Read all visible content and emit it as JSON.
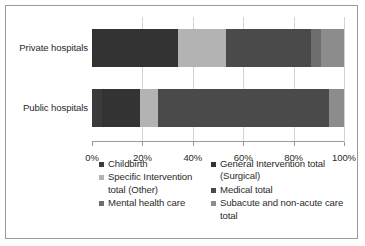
{
  "chart_data": {
    "type": "bar",
    "orientation": "horizontal",
    "stacked": true,
    "percent": true,
    "title": "",
    "xlabel": "",
    "ylabel": "",
    "xlim": [
      0,
      100
    ],
    "grid": true,
    "legend_position": "bottom",
    "tick_labels": [
      "0%",
      "20%",
      "40%",
      "60%",
      "80%",
      "100%"
    ],
    "tick_values": [
      0,
      20,
      40,
      60,
      80,
      100
    ],
    "categories": [
      "Private hospitals",
      "Public hospitals"
    ],
    "series": [
      {
        "name": "Childbirth",
        "color": "#3b3b3b",
        "values": [
          0.0,
          4.0
        ]
      },
      {
        "name": "General Intervention total (Surgical)",
        "color": "#333333",
        "values": [
          34.0,
          15.0
        ]
      },
      {
        "name": "Specific Intervention total (Other)",
        "color": "#b3b3b3",
        "values": [
          19.0,
          7.0
        ]
      },
      {
        "name": "Medical total",
        "color": "#4a4a4a",
        "values": [
          34.0,
          68.0
        ]
      },
      {
        "name": "Mental health care",
        "color": "#6e6e6e",
        "values": [
          4.0,
          0.0
        ]
      },
      {
        "name": "Subacute and non-acute care total",
        "color": "#8c8c8c",
        "values": [
          9.0,
          6.0
        ]
      }
    ],
    "legend_left": [
      {
        "label": "Childbirth",
        "color": "#3b3b3b"
      },
      {
        "label": "Specific Intervention total (Other)",
        "color": "#b3b3b3"
      },
      {
        "label": "Mental health care",
        "color": "#6e6e6e"
      }
    ],
    "legend_right": [
      {
        "label": "General Intervention total (Surgical)",
        "color": "#333333"
      },
      {
        "label": "Medical total",
        "color": "#4a4a4a"
      },
      {
        "label": "Subacute and non-acute care total",
        "color": "#8c8c8c"
      }
    ]
  }
}
